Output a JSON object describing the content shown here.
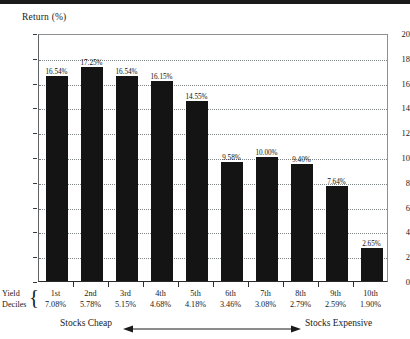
{
  "chart_data": {
    "type": "bar",
    "title": "Return (%)",
    "ylabel": "Return (%)",
    "xlabel": "Yield Deciles",
    "ylim": [
      0,
      20
    ],
    "ytick_step": 2,
    "yticks": [
      "0",
      "2",
      "4",
      "6",
      "8",
      "10",
      "12",
      "14",
      "16",
      "18",
      "20"
    ],
    "grid": true,
    "legend": null,
    "categories": [
      "1st",
      "2nd",
      "3rd",
      "4th",
      "5th",
      "6th",
      "7th",
      "8th",
      "9th",
      "10th"
    ],
    "values": [
      16.54,
      17.25,
      16.54,
      16.15,
      14.55,
      9.58,
      10.0,
      9.4,
      7.64,
      2.65
    ],
    "value_labels": [
      "16.54%",
      "17.25%",
      "16.54%",
      "16.15%",
      "14.55%",
      "9.58%",
      "10.00%",
      "9.40%",
      "7.64%",
      "2.65%"
    ],
    "secondary_axis_name": "Yield Deciles",
    "yield_labels": [
      "7.08%",
      "5.78%",
      "5.15%",
      "4.68%",
      "4.18%",
      "3.46%",
      "3.08%",
      "2.79%",
      "2.59%",
      "1.90%"
    ],
    "annotations": {
      "left": "Stocks Cheap",
      "right": "Stocks Expensive",
      "arrow": "double-headed-horizontal"
    },
    "bar_color": "#141414"
  },
  "axis": {
    "title": "Return (%)",
    "decile_line1": "Yield",
    "decile_line2": "Deciles",
    "brace": "{"
  },
  "footer": {
    "cheap": "Stocks Cheap",
    "expensive": "Stocks Expensive"
  }
}
